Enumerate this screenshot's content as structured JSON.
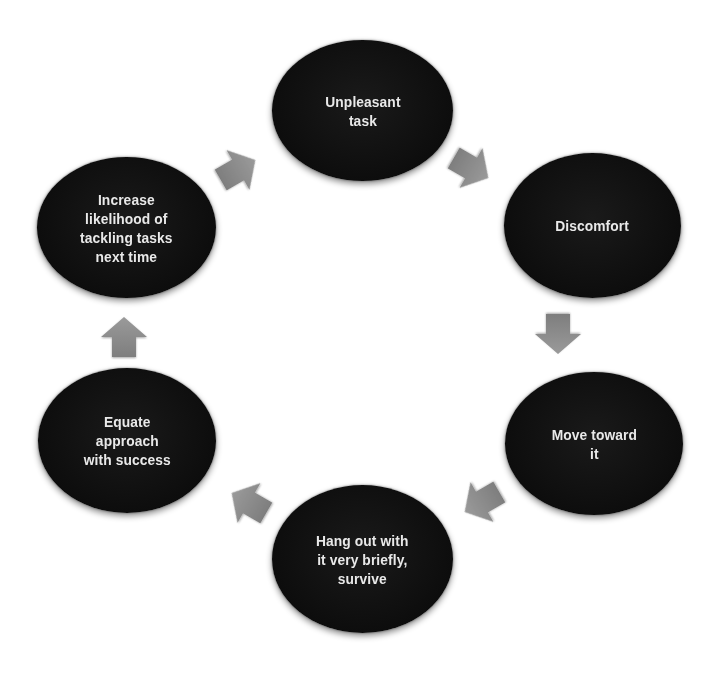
{
  "diagram": {
    "type": "cycle",
    "node_fill": "#0d0d0d",
    "node_text_color": "#e9e9e9",
    "arrow_color": "#8c8c8c",
    "nodes": [
      {
        "id": "unpleasant-task",
        "label": "Unpleasant\ntask"
      },
      {
        "id": "discomfort",
        "label": "Discomfort"
      },
      {
        "id": "move-toward-it",
        "label": "Move toward\nit"
      },
      {
        "id": "hang-out",
        "label": "Hang out with\nit very briefly,\nsurvive"
      },
      {
        "id": "equate-approach",
        "label": "Equate\napproach\nwith success"
      },
      {
        "id": "increase-likelihood",
        "label": "Increase\nlikelihood of\ntackling tasks\nnext time"
      }
    ],
    "edges": [
      {
        "from": "unpleasant-task",
        "to": "discomfort",
        "direction": "down-right"
      },
      {
        "from": "discomfort",
        "to": "move-toward-it",
        "direction": "down"
      },
      {
        "from": "move-toward-it",
        "to": "hang-out",
        "direction": "down-left"
      },
      {
        "from": "hang-out",
        "to": "equate-approach",
        "direction": "up-left"
      },
      {
        "from": "equate-approach",
        "to": "increase-likelihood",
        "direction": "up"
      },
      {
        "from": "increase-likelihood",
        "to": "unpleasant-task",
        "direction": "up-right"
      }
    ]
  }
}
